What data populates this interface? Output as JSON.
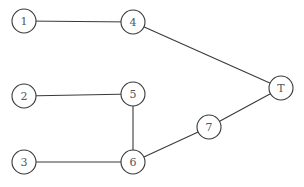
{
  "diagram": {
    "type": "undirected-graph",
    "nodes": [
      {
        "id": "1",
        "label": "1"
      },
      {
        "id": "2",
        "label": "2"
      },
      {
        "id": "3",
        "label": "3"
      },
      {
        "id": "4",
        "label": "4"
      },
      {
        "id": "5",
        "label": "5"
      },
      {
        "id": "6",
        "label": "6"
      },
      {
        "id": "7",
        "label": "7"
      },
      {
        "id": "T",
        "label": "T"
      }
    ],
    "edges": [
      {
        "from": "1",
        "to": "4"
      },
      {
        "from": "4",
        "to": "T"
      },
      {
        "from": "2",
        "to": "5"
      },
      {
        "from": "5",
        "to": "6"
      },
      {
        "from": "3",
        "to": "6"
      },
      {
        "from": "6",
        "to": "7"
      },
      {
        "from": "7",
        "to": "T"
      }
    ]
  }
}
